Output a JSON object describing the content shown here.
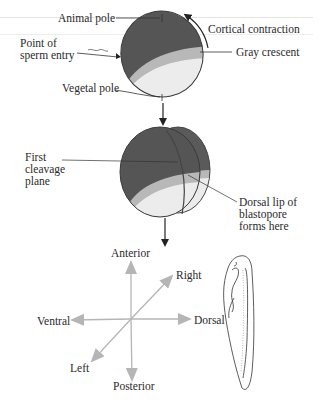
{
  "figure": {
    "stage1": {
      "labels": {
        "animal_pole": "Animal pole",
        "cortical_contraction": "Cortical contraction",
        "sperm_entry_line1": "Point of",
        "sperm_entry_line2": "sperm entry",
        "gray_crescent": "Gray crescent",
        "vegetal_pole": "Vegetal pole"
      }
    },
    "stage2": {
      "labels": {
        "cleavage_line1": "First",
        "cleavage_line2": "cleavage",
        "cleavage_line3": "plane",
        "dorsal_lip_line1": "Dorsal lip of",
        "dorsal_lip_line2": "blastopore",
        "dorsal_lip_line3": "forms here"
      }
    },
    "axes": {
      "anterior": "Anterior",
      "posterior": "Posterior",
      "ventral": "Ventral",
      "dorsal": "Dorsal",
      "right": "Right",
      "left": "Left"
    },
    "colors": {
      "animal_hemisphere": "#555555",
      "vegetal_hemisphere": "#ececec",
      "gray_crescent": "#b8b8b8",
      "axis_arrow": "#b5b5b5",
      "leader_line": "#333333"
    }
  }
}
